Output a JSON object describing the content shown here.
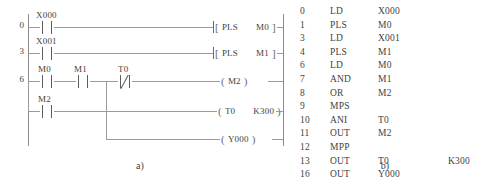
{
  "figure": {
    "caption_a": "a)",
    "caption_b": "b)"
  },
  "ladder": {
    "rungs": [
      {
        "step": "0",
        "contacts": [
          {
            "label": "X000",
            "type": "normally-open"
          }
        ],
        "output": {
          "kind": "instruction-box",
          "instruction": "PLS",
          "operand": "M0"
        }
      },
      {
        "step": "3",
        "contacts": [
          {
            "label": "X001",
            "type": "normally-open"
          }
        ],
        "output": {
          "kind": "instruction-box",
          "instruction": "PLS",
          "operand": "M1"
        }
      },
      {
        "step": "6",
        "contacts": [
          {
            "label": "M0",
            "type": "normally-open"
          },
          {
            "label": "M1",
            "type": "normally-open"
          },
          {
            "label": "T0",
            "type": "normally-closed"
          }
        ],
        "output": {
          "kind": "coil",
          "operand": "M2"
        }
      },
      {
        "step": "",
        "contacts": [
          {
            "label": "M2",
            "type": "normally-open"
          }
        ],
        "output": {
          "kind": "coil",
          "operand": "T0",
          "preset": "K300"
        }
      },
      {
        "step": "",
        "contacts": [],
        "output": {
          "kind": "coil",
          "operand": "Y000"
        }
      }
    ]
  },
  "instruction_list": {
    "columns": [
      "step",
      "instruction",
      "operand",
      "extra"
    ],
    "rows": [
      {
        "step": "0",
        "instruction": "LD",
        "operand": "X000",
        "extra": ""
      },
      {
        "step": "1",
        "instruction": "PLS",
        "operand": "M0",
        "extra": ""
      },
      {
        "step": "3",
        "instruction": "LD",
        "operand": "X001",
        "extra": ""
      },
      {
        "step": "4",
        "instruction": "PLS",
        "operand": "M1",
        "extra": ""
      },
      {
        "step": "6",
        "instruction": "LD",
        "operand": "M0",
        "extra": ""
      },
      {
        "step": "7",
        "instruction": "AND",
        "operand": "M1",
        "extra": ""
      },
      {
        "step": "8",
        "instruction": "OR",
        "operand": "M2",
        "extra": ""
      },
      {
        "step": "9",
        "instruction": "MPS",
        "operand": "",
        "extra": ""
      },
      {
        "step": "10",
        "instruction": "ANI",
        "operand": "T0",
        "extra": ""
      },
      {
        "step": "11",
        "instruction": "OUT",
        "operand": "M2",
        "extra": ""
      },
      {
        "step": "12",
        "instruction": "MPP",
        "operand": "",
        "extra": ""
      },
      {
        "step": "13",
        "instruction": "OUT",
        "operand": "T0",
        "extra": "K300"
      },
      {
        "step": "16",
        "instruction": "OUT",
        "operand": "Y000",
        "extra": ""
      }
    ]
  },
  "colors": {
    "background": "#ffffff",
    "line": "#9a9a9a",
    "rail": "#8a8a8a",
    "text": "#3f3f3f"
  }
}
